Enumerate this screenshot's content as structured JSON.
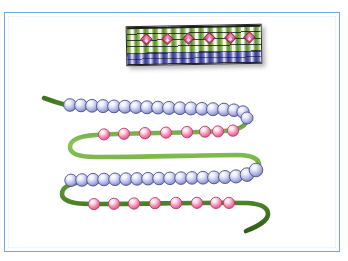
{
  "image": {
    "title": "Beaded cord illustration",
    "width": 348,
    "height": 261,
    "background_color": "#ffffff",
    "border_color": "#6aa9e0",
    "border_inner_color": "#eef5fc"
  },
  "woven_band": {
    "name": "woven beaded band",
    "x": 126,
    "y": 25,
    "width": 136,
    "height": 40,
    "rotation_deg": -1.1,
    "warp_color": "#5f9236",
    "warp_highlight_color": "#f4f3ea",
    "weft_line_color": "#141414",
    "lower_row_color": "#3b3f8f",
    "motif_color": "#e2548c",
    "motif_count": 6,
    "motif_shape": "diamond",
    "shadow_color": "rgba(60,60,60,0.38)"
  },
  "cord": {
    "name": "green cord",
    "color": "#4e8b2a",
    "highlight_color": "#8cc45a",
    "edge_color": "#2f5f18",
    "width_px": 4.6
  },
  "strands": [
    {
      "id": "strand-1",
      "bead_color_name": "periwinkle blue",
      "bead_fill": "#b9bde4",
      "bead_highlight": "#ffffff",
      "bead_outline": "#4a4f96",
      "bead_count": 19,
      "bead_radius": 6.4,
      "spacing": "touching"
    },
    {
      "id": "strand-2",
      "bead_color_name": "rose pink",
      "bead_fill": "#f090b4",
      "bead_highlight": "#ffffff",
      "bead_outline": "#c03d74",
      "bead_count": 8,
      "bead_radius": 5.6,
      "spacing": "spaced"
    },
    {
      "id": "strand-3",
      "bead_color_name": "periwinkle blue",
      "bead_fill": "#b9bde4",
      "bead_highlight": "#ffffff",
      "bead_outline": "#4a4f96",
      "bead_count": 19,
      "bead_radius": 6.4,
      "spacing": "touching"
    },
    {
      "id": "strand-4",
      "bead_color_name": "rose pink",
      "bead_fill": "#f090b4",
      "bead_highlight": "#ffffff",
      "bead_outline": "#c03d74",
      "bead_count": 8,
      "bead_radius": 5.6,
      "spacing": "spaced"
    }
  ]
}
